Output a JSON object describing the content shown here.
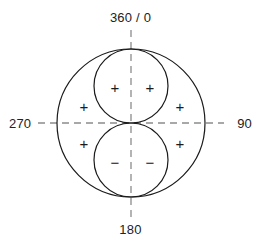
{
  "diagram": {
    "axis_labels": {
      "top": "360 / 0",
      "right": "90",
      "bottom": "180",
      "left": "270"
    },
    "signs": {
      "plus": "+",
      "minus": "−"
    },
    "markers": [
      {
        "name": "marker-inner-upper-left",
        "sign": "+",
        "x": 115,
        "y": 87
      },
      {
        "name": "marker-inner-upper-right",
        "sign": "+",
        "x": 150,
        "y": 87
      },
      {
        "name": "marker-outer-left-upper",
        "sign": "+",
        "x": 84,
        "y": 106
      },
      {
        "name": "marker-outer-right-upper",
        "sign": "+",
        "x": 180,
        "y": 106
      },
      {
        "name": "marker-outer-left-lower",
        "sign": "+",
        "x": 84,
        "y": 143
      },
      {
        "name": "marker-outer-right-lower",
        "sign": "+",
        "x": 180,
        "y": 143
      },
      {
        "name": "marker-inner-lower-left",
        "sign": "−",
        "x": 115,
        "y": 162
      },
      {
        "name": "marker-inner-lower-right",
        "sign": "−",
        "x": 150,
        "y": 162
      }
    ],
    "geometry": {
      "center_x": 131,
      "center_y": 123,
      "outer_radius": 74,
      "inner_radius": 37,
      "inner_upper_center_y": 86,
      "inner_lower_center_y": 160,
      "h_axis_start_x": 38,
      "h_axis_end_x": 224,
      "v_axis_start_y": 30,
      "v_axis_end_y": 217
    },
    "colors": {
      "stroke": "#1a1a1a",
      "dash": "#8c8c8c",
      "text": "#222222",
      "background": "#ffffff"
    }
  }
}
